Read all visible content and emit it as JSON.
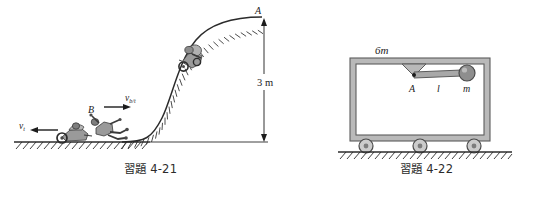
{
  "page": {
    "width": 537,
    "height": 197,
    "background": "#ffffff",
    "content_type": "textbook-physics-figure-pair"
  },
  "figures": [
    {
      "id": "figure-4-21",
      "caption": "習題 4-21",
      "description": "motorcycle-stunt-ramp-hill",
      "labels": [
        {
          "name": "point-a-label",
          "text": "A",
          "style": "italic"
        },
        {
          "name": "point-b-label",
          "text": "B",
          "style": "italic"
        },
        {
          "name": "height-dimension-label",
          "text": "3 m",
          "style": "roman"
        },
        {
          "name": "velocity-truck-label",
          "base": "v",
          "sub": "t"
        },
        {
          "name": "velocity-bike-relative-label",
          "base": "v",
          "sub": "b/t"
        }
      ],
      "dimension": {
        "value": "3",
        "unit": "m",
        "text": "3 m"
      }
    },
    {
      "id": "figure-4-22",
      "caption": "習題 4-22",
      "description": "cart-on-wheels-with-pendulum",
      "labels": [
        {
          "name": "cart-mass-label",
          "base": "6m",
          "text": "6m",
          "style": "italic"
        },
        {
          "name": "pivot-a-label",
          "text": "A",
          "style": "italic"
        },
        {
          "name": "rod-length-label",
          "text": "l",
          "style": "italic"
        },
        {
          "name": "bob-mass-label",
          "text": "m",
          "style": "italic"
        }
      ],
      "wheel_count": 3
    }
  ],
  "colors": {
    "ink": "#1c1c1c",
    "line": "#2b2b2b",
    "cart_fill": "#b9b9b9",
    "cart_inner": "#ffffff",
    "bob_fill": "#8e8e8e",
    "rod_fill": "#a8a8a8",
    "rider_fill": "#9a9a9a",
    "rider_dark": "#4a4a4a",
    "ground": "#2b2b2b"
  }
}
